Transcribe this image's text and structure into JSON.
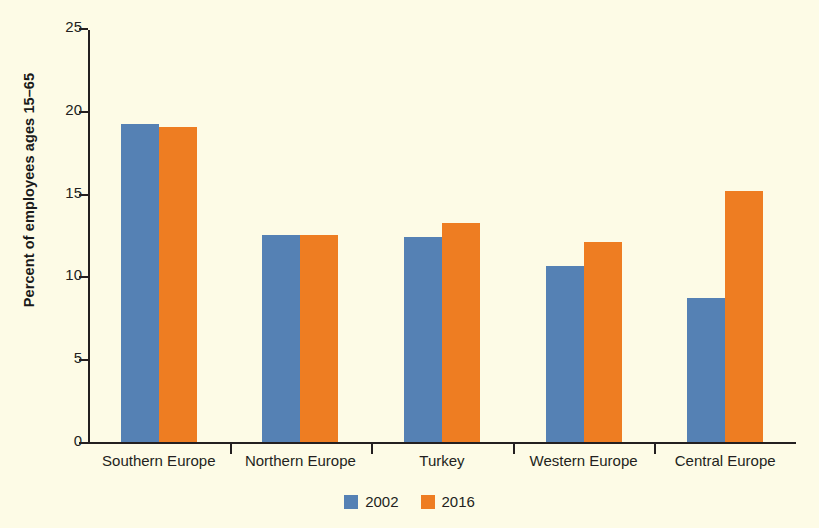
{
  "chart_data": {
    "type": "bar",
    "title": "",
    "subtitle": "",
    "xlabel": "",
    "ylabel": "Percent of employees ages 15–65",
    "ylim": [
      0,
      25
    ],
    "yticks": [
      0,
      5,
      10,
      15,
      20,
      25
    ],
    "ytick_labels": [
      "0",
      "5",
      "10",
      "15",
      "20",
      "25"
    ],
    "grid": false,
    "legend_position": "bottom-center",
    "categories": [
      "Southern Europe",
      "Northern Europe",
      "Turkey",
      "Western Europe",
      "Central Europe"
    ],
    "series": [
      {
        "name": "2002",
        "color": "#5581b4",
        "values": [
          19.2,
          12.5,
          12.4,
          10.6,
          8.7
        ]
      },
      {
        "name": "2016",
        "color": "#ee7d22",
        "values": [
          19.0,
          12.5,
          13.2,
          12.1,
          15.15
        ]
      }
    ]
  },
  "colors": {
    "background": "#fdfbe6",
    "axis": "#231f20",
    "series_2002": "#5581b4",
    "series_2016": "#ee7d22"
  }
}
